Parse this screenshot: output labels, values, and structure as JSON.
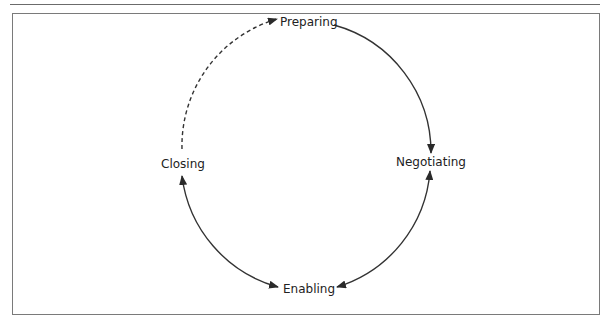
{
  "diagram": {
    "type": "cycle",
    "stages": [
      {
        "id": "preparing",
        "label": "Preparing"
      },
      {
        "id": "negotiating",
        "label": "Negotiating"
      },
      {
        "id": "enabling",
        "label": "Enabling"
      },
      {
        "id": "closing",
        "label": "Closing"
      }
    ],
    "connections": [
      {
        "from": "Preparing",
        "to": "Negotiating",
        "style": "solid",
        "direction": "one-way"
      },
      {
        "from": "Negotiating",
        "to": "Enabling",
        "style": "solid",
        "direction": "two-way"
      },
      {
        "from": "Enabling",
        "to": "Closing",
        "style": "solid",
        "direction": "two-way"
      },
      {
        "from": "Closing",
        "to": "Preparing",
        "style": "dashed",
        "direction": "one-way"
      }
    ],
    "colors": {
      "stroke": "#333333",
      "text": "#222222",
      "border": "#7a7a7a"
    }
  }
}
